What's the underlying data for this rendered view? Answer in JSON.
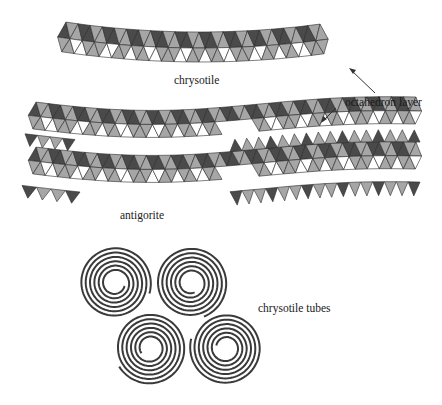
{
  "figure": {
    "width": 442,
    "height": 405,
    "background": "#ffffff"
  },
  "labels": {
    "chrysotile": "chrysotile",
    "octahedron_layer": "octahedron layer",
    "antigorite": "antigorite",
    "chrysotile_tubes": "chrysotile tubes"
  },
  "colors": {
    "dark": "#4a4a4a",
    "mid": "#a6a6a6",
    "light": "#ffffff",
    "stroke": "#2a2a2a",
    "spiral": "#3a3a3a",
    "arrow": "#333333"
  },
  "structures": {
    "chrysotile": {
      "description": "curved sheet: octahedral layer over tetrahedral layer, bent upward"
    },
    "antigorite": {
      "description": "two stacked wavy sheets with alternating inverted tetrahedral segments"
    },
    "chrysotile_tubes": {
      "count": 4,
      "description": "four spiral cross-sections of rolled sheets"
    }
  }
}
